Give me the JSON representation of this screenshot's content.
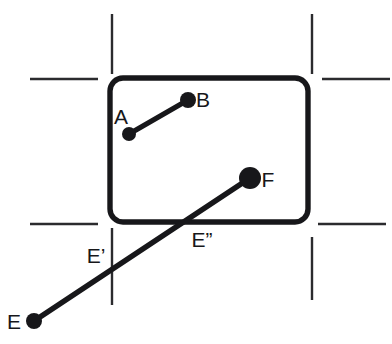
{
  "figure": {
    "width": 392,
    "height": 344,
    "background_color": "#ffffff",
    "ink_color": "#17171a",
    "crop_mark_color": "#2b2b2e"
  },
  "labels": {
    "a": "A",
    "b": "B",
    "e": "E",
    "e_prime": "E’",
    "e_double_prime": "E”",
    "f": "F"
  },
  "points": {
    "A": {
      "label": "A",
      "x": 129,
      "y": 134,
      "label_x": 128,
      "label_y": 124,
      "dot_r": 7
    },
    "B": {
      "label": "B",
      "x": 188,
      "y": 100,
      "label_x": 203,
      "label_y": 107,
      "dot_r": 8
    },
    "E": {
      "label": "E",
      "x": 34,
      "y": 321,
      "label_x": 14,
      "label_y": 329,
      "dot_r": 8
    },
    "F": {
      "label": "F",
      "x": 250,
      "y": 178,
      "label_x": 268,
      "label_y": 187,
      "dot_r": 11
    },
    "E_prime": {
      "label": "E’",
      "x": 112,
      "y": 270,
      "label_x": 96,
      "label_y": 263,
      "dot_r": 0
    },
    "E_double_prime": {
      "label": "E”",
      "x": 192,
      "y": 221,
      "label_x": 200,
      "label_y": 247,
      "dot_r": 0
    }
  },
  "segments": [
    {
      "name": "segment-ab",
      "from": "A",
      "to": "B",
      "x1": 129,
      "y1": 134,
      "x2": 188,
      "y2": 100,
      "stroke_width": 5.2
    },
    {
      "name": "segment-ef",
      "from": "E",
      "to": "F",
      "x1": 34,
      "y1": 321,
      "x2": 250,
      "y2": 178,
      "stroke_width": 5.6
    }
  ],
  "frame": {
    "name": "rounded-rectangle-window",
    "x": 110,
    "y": 78,
    "width": 198,
    "height": 144,
    "rx": 13,
    "stroke_width": 5.4
  },
  "crop_marks": [
    {
      "name": "crop-mark-top-left-vertical",
      "x1": 112,
      "y1": 14,
      "x2": 112,
      "y2": 74
    },
    {
      "name": "crop-mark-top-left-horizontal",
      "x1": 30,
      "y1": 79,
      "x2": 98,
      "y2": 79
    },
    {
      "name": "crop-mark-top-right-vertical",
      "x1": 312,
      "y1": 14,
      "x2": 312,
      "y2": 74
    },
    {
      "name": "crop-mark-top-right-horizontal",
      "x1": 322,
      "y1": 79,
      "x2": 390,
      "y2": 79
    },
    {
      "name": "crop-mark-bottom-left-horizontal",
      "x1": 30,
      "y1": 224,
      "x2": 98,
      "y2": 224
    },
    {
      "name": "crop-mark-bottom-left-vertical",
      "x1": 112,
      "y1": 228,
      "x2": 112,
      "y2": 305
    },
    {
      "name": "crop-mark-bottom-right-horizontal",
      "x1": 318,
      "y1": 224,
      "x2": 386,
      "y2": 224
    },
    {
      "name": "crop-mark-bottom-right-vertical",
      "x1": 312,
      "y1": 237,
      "x2": 312,
      "y2": 300
    }
  ]
}
